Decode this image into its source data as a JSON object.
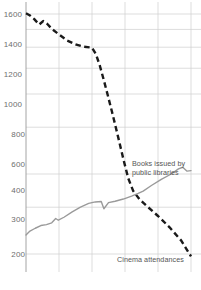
{
  "chart_data": {
    "type": "line",
    "title": "",
    "xlabel": "",
    "ylabel": "",
    "yscale": "log",
    "ylim": [
      170,
      1750
    ],
    "grid": true,
    "legend_position": "inline-annotations",
    "yticks": [
      200,
      300,
      400,
      600,
      800,
      1000,
      1200,
      1400,
      1600
    ],
    "ytick_labels": [
      "200",
      "300",
      "400",
      "600",
      "800",
      "1000",
      "1200",
      "1400",
      "1600"
    ],
    "xticks": [
      0,
      1,
      2,
      3,
      4,
      5
    ],
    "xtick_labels": [
      "",
      "",
      "",
      "",
      "",
      ""
    ],
    "colors": {
      "cinema": "#1a1a1a",
      "books": "#9a9a9a",
      "grid": "#cfcfcf",
      "axis": "#9a9a9a",
      "tick_text": "#6e6e6e",
      "annotation_text": "#555555",
      "background": "#ffffff"
    },
    "series": [
      {
        "name": "Cinema attendances",
        "style": "dashed",
        "color": "#1a1a1a",
        "points": [
          [
            0.0,
            1610
          ],
          [
            0.12,
            1580
          ],
          [
            0.25,
            1530
          ],
          [
            0.4,
            1460
          ],
          [
            0.52,
            1505
          ],
          [
            0.64,
            1470
          ],
          [
            0.8,
            1400
          ],
          [
            1.0,
            1340
          ],
          [
            1.25,
            1270
          ],
          [
            1.5,
            1230
          ],
          [
            1.75,
            1205
          ],
          [
            2.0,
            1195
          ],
          [
            2.12,
            1130
          ],
          [
            2.24,
            1020
          ],
          [
            2.36,
            900
          ],
          [
            2.48,
            790
          ],
          [
            2.6,
            690
          ],
          [
            2.72,
            600
          ],
          [
            2.84,
            520
          ],
          [
            2.96,
            450
          ],
          [
            3.1,
            385
          ],
          [
            3.25,
            345
          ],
          [
            3.45,
            320
          ],
          [
            3.7,
            300
          ],
          [
            4.0,
            278
          ],
          [
            4.35,
            252
          ],
          [
            4.7,
            225
          ],
          [
            5.0,
            196
          ]
        ]
      },
      {
        "name": "Books issued by public libraries",
        "style": "solid",
        "color": "#9a9a9a",
        "points": [
          [
            0.0,
            236
          ],
          [
            0.12,
            244
          ],
          [
            0.28,
            250
          ],
          [
            0.45,
            256
          ],
          [
            0.62,
            258
          ],
          [
            0.78,
            262
          ],
          [
            0.9,
            272
          ],
          [
            0.98,
            268
          ],
          [
            1.15,
            275
          ],
          [
            1.4,
            288
          ],
          [
            1.65,
            300
          ],
          [
            1.9,
            310
          ],
          [
            2.1,
            314
          ],
          [
            2.28,
            315
          ],
          [
            2.36,
            296
          ],
          [
            2.5,
            312
          ],
          [
            2.7,
            316
          ],
          [
            2.95,
            322
          ],
          [
            3.2,
            330
          ],
          [
            3.4,
            338
          ],
          [
            3.55,
            345
          ],
          [
            3.8,
            362
          ],
          [
            4.1,
            382
          ],
          [
            4.4,
            400
          ],
          [
            4.62,
            418
          ],
          [
            4.75,
            424
          ],
          [
            4.88,
            410
          ],
          [
            5.0,
            412
          ]
        ]
      }
    ],
    "annotations": [
      {
        "name": "books-label",
        "text_line1": "Books issued by",
        "text_line2": "public libraries"
      },
      {
        "name": "cinema-label",
        "text_line1": "Cinema attendances",
        "text_line2": ""
      }
    ]
  }
}
